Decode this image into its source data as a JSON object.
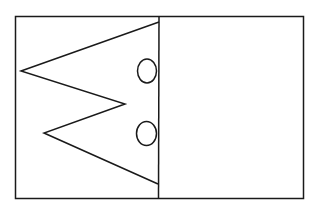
{
  "canvas": {
    "width": 314,
    "height": 217,
    "background": "#ffffff"
  },
  "stroke": {
    "color": "#1a1a1a",
    "width": 1.5
  },
  "outer_rect": {
    "x": 15.5,
    "y": 16.5,
    "width": 288,
    "height": 182
  },
  "divider": {
    "x1": 159,
    "y1": 16.5,
    "x2": 158.5,
    "y2": 198.5
  },
  "zigzag": {
    "points": "159,22 21,71 125,104 44,133 158,184"
  },
  "circles": [
    {
      "cx": 147,
      "cy": 71,
      "rx": 9.5,
      "ry": 12
    },
    {
      "cx": 146.5,
      "cy": 133.5,
      "rx": 10,
      "ry": 12
    }
  ]
}
